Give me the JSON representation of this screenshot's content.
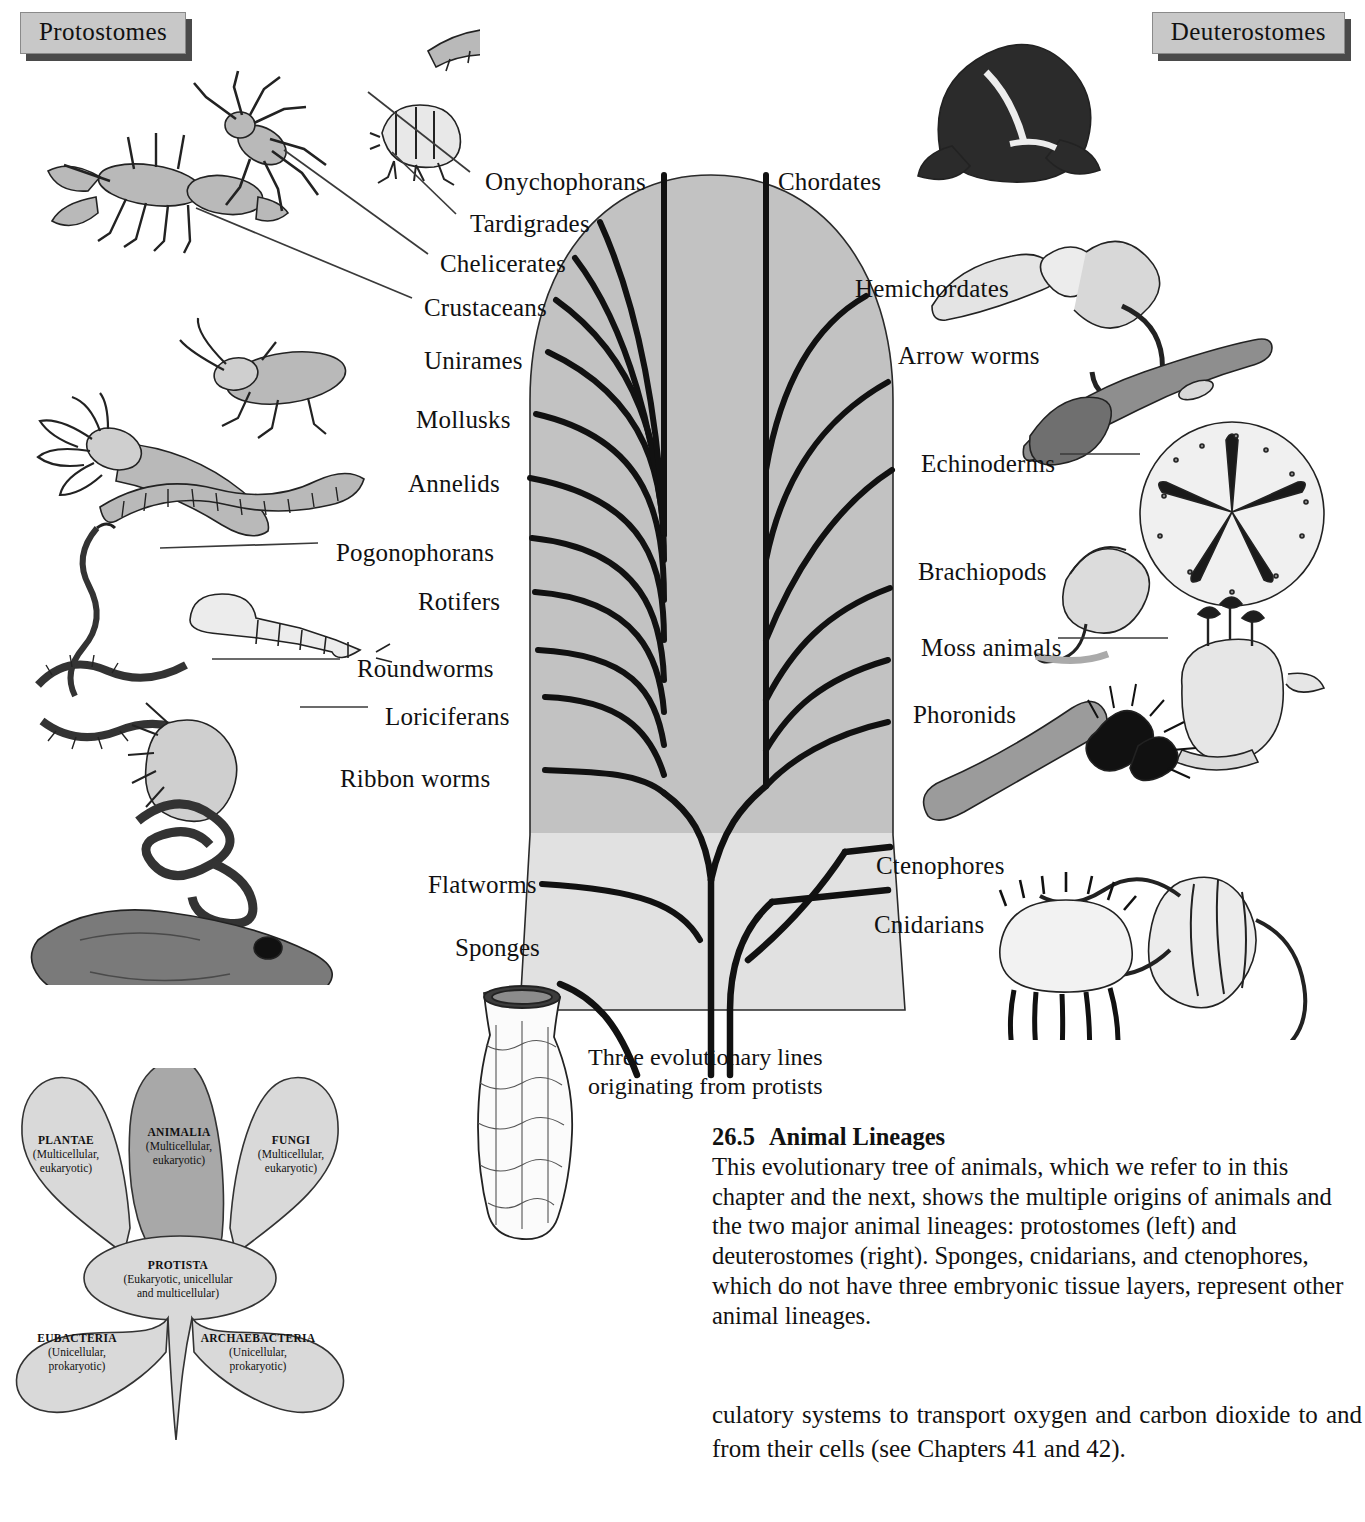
{
  "figure": {
    "headers": {
      "left": "Protostomes",
      "right": "Deuterostomes"
    },
    "caption": {
      "number": "26.5",
      "title": "Animal Lineages",
      "body": "This evolutionary tree of animals, which we refer to in this chapter and the next, shows the multiple origins of animals and the two major animal lineages: protostomes (left) and deuterostomes (right). Sponges, cnidarians, and ctenophores, which do not have three embryonic tissue layers, represent other animal lineages."
    },
    "root_note": "Three evolutionary lines\noriginating from protists",
    "sponges_label": "Sponges",
    "left_taxa": [
      {
        "label": "Onychophorans",
        "x": 485,
        "y": 168,
        "leader": false
      },
      {
        "label": "Tardigrades",
        "x": 470,
        "y": 210,
        "leader": false
      },
      {
        "label": "Chelicerates",
        "x": 440,
        "y": 250,
        "leader": false
      },
      {
        "label": "Crustaceans",
        "x": 424,
        "y": 294,
        "leader": false
      },
      {
        "label": "Unirames",
        "x": 424,
        "y": 347,
        "leader": false
      },
      {
        "label": "Mollusks",
        "x": 416,
        "y": 406,
        "leader": false
      },
      {
        "label": "Annelids",
        "x": 408,
        "y": 470,
        "leader": false
      },
      {
        "label": "Pogonophorans",
        "x": 336,
        "y": 539,
        "leader": true
      },
      {
        "label": "Rotifers",
        "x": 418,
        "y": 588,
        "leader": false
      },
      {
        "label": "Roundworms",
        "x": 357,
        "y": 655,
        "leader": true
      },
      {
        "label": "Loriciferans",
        "x": 385,
        "y": 703,
        "leader": true
      },
      {
        "label": "Ribbon worms",
        "x": 340,
        "y": 765,
        "leader": false
      },
      {
        "label": "Flatworms",
        "x": 428,
        "y": 871,
        "leader": false
      }
    ],
    "right_taxa": [
      {
        "label": "Chordates",
        "x": 778,
        "y": 168,
        "leader": false
      },
      {
        "label": "Hemichordates",
        "x": 855,
        "y": 275,
        "leader": false
      },
      {
        "label": "Arrow worms",
        "x": 898,
        "y": 342,
        "leader": false
      },
      {
        "label": "Echinoderms",
        "x": 921,
        "y": 450,
        "leader": true
      },
      {
        "label": "Brachiopods",
        "x": 918,
        "y": 558,
        "leader": false
      },
      {
        "label": "Moss animals",
        "x": 921,
        "y": 634,
        "leader": true
      },
      {
        "label": "Phoronids",
        "x": 913,
        "y": 701,
        "leader": false
      },
      {
        "label": "Ctenophores",
        "x": 876,
        "y": 852,
        "leader": false
      },
      {
        "label": "Cnidarians",
        "x": 874,
        "y": 911,
        "leader": false
      }
    ],
    "kingdoms": [
      {
        "name": "PLANTAE",
        "sub": "(Multicellular,\neukaryotic)",
        "x": 66,
        "y": 1133
      },
      {
        "name": "ANIMALIA",
        "sub": "(Multicellular,\neukaryotic)",
        "x": 179,
        "y": 1125
      },
      {
        "name": "FUNGI",
        "sub": "(Multicellular,\neukaryotic)",
        "x": 291,
        "y": 1133
      },
      {
        "name": "PROTISTA",
        "sub": "(Eukaryotic, unicellular\nand multicellular)",
        "x": 178,
        "y": 1258
      },
      {
        "name": "EUBACTERIA",
        "sub": "(Unicellular,\nprokaryotic)",
        "x": 77,
        "y": 1331
      },
      {
        "name": "ARCHAEBACTERIA",
        "sub": "(Unicellular,\nprokaryotic)",
        "x": 258,
        "y": 1331
      }
    ],
    "colors": {
      "tree_upper_gray": "#c2c2c2",
      "tree_lower_gray": "#e1e1e1",
      "plaque_gray": "#c8c8c8",
      "plaque_shadow": "#4a4a4a",
      "ink": "#111111",
      "petal_light": "#d9d9d9",
      "petal_dark": "#a8a8a8"
    }
  },
  "bodytext": "culatory systems to transport oxygen and carbon dioxide to and from their cells (see Chapters 41 and 42)."
}
